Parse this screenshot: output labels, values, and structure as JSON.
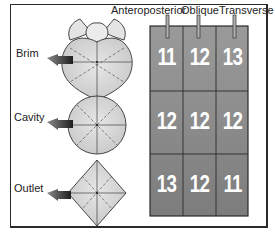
{
  "labels": {
    "rows": [
      "Brim",
      "Cavity",
      "Outlet"
    ],
    "columns": [
      "Anteroposterior",
      "Oblique",
      "Transverse"
    ]
  },
  "grid": {
    "values": [
      [
        "11",
        "12",
        "13"
      ],
      [
        "12",
        "12",
        "12"
      ],
      [
        "13",
        "12",
        "11"
      ]
    ],
    "cell_color": "#8a8a8a",
    "line_color": "#2b2b2b",
    "number_color": "#ffffff"
  },
  "shapes": {
    "brim": "heart-shaped pelvic inlet",
    "cavity": "circular pelvic cavity",
    "outlet": "diamond-shaped pelvic outlet",
    "fill": "#d6d6d6",
    "arrow_color": "#3a3a3a"
  }
}
